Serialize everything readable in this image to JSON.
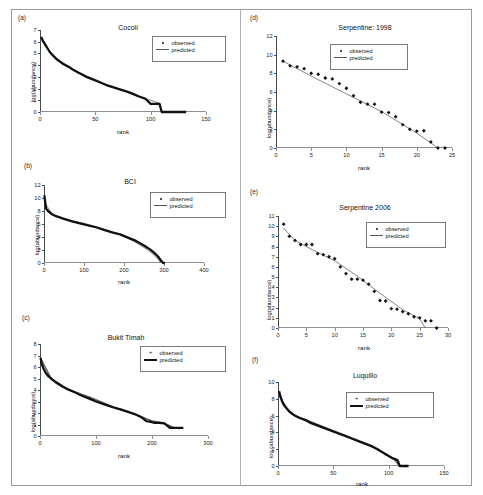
{
  "figure": {
    "background": "#ffffff",
    "frame_color": "#9a9a9a",
    "observed_color": "#111111",
    "predicted_color": "#666666"
  },
  "legend_labels": {
    "observed": "observed",
    "predicted": "predicted"
  },
  "chart_data": [
    {
      "panel": "(a)",
      "type": "line",
      "title": "Cocoli",
      "xlabel": "rank",
      "ylabel": "log(abundance)",
      "xlim": [
        0,
        150
      ],
      "ylim": [
        0,
        7
      ],
      "xticks": [
        0,
        50,
        100,
        150
      ],
      "yticks": [
        0,
        1,
        2,
        3,
        4,
        5,
        6,
        7
      ],
      "grid": false,
      "legend": [
        "observed",
        "predicted"
      ],
      "legend_position": "upper-right",
      "series": [
        {
          "name": "observed",
          "marker": "filled-square",
          "x": [
            1,
            3,
            5,
            7,
            9,
            11,
            13,
            15,
            18,
            21,
            24,
            27,
            30,
            34,
            38,
            42,
            46,
            50,
            55,
            60,
            65,
            70,
            75,
            80,
            85,
            90,
            95,
            100,
            104,
            108,
            110,
            112,
            116,
            120,
            124,
            128,
            132
          ],
          "y": [
            6.4,
            6.0,
            5.7,
            5.4,
            5.1,
            4.9,
            4.7,
            4.5,
            4.3,
            4.1,
            3.95,
            3.8,
            3.6,
            3.4,
            3.2,
            3.0,
            2.85,
            2.7,
            2.5,
            2.3,
            2.15,
            2.0,
            1.85,
            1.7,
            1.5,
            1.3,
            1.15,
            0.7,
            0.7,
            0.7,
            0.0,
            0.0,
            0.0,
            0.0,
            0.0,
            0.0,
            0.0
          ]
        },
        {
          "name": "predicted",
          "x": [
            1,
            10,
            20,
            30,
            40,
            50,
            60,
            70,
            80,
            90,
            100,
            108,
            110
          ],
          "y": [
            6.45,
            5.0,
            4.25,
            3.65,
            3.15,
            2.75,
            2.35,
            2.0,
            1.65,
            1.3,
            1.0,
            0.75,
            0.0
          ]
        }
      ]
    },
    {
      "panel": "(b)",
      "type": "line",
      "title": "BCI",
      "xlabel": "rank",
      "ylabel": "log(abundance)",
      "xlim": [
        0,
        400
      ],
      "ylim": [
        0,
        12
      ],
      "xticks": [
        0,
        100,
        200,
        300,
        400
      ],
      "yticks": [
        0,
        2,
        4,
        6,
        8,
        10,
        12
      ],
      "grid": false,
      "legend": [
        "observed",
        "predicted"
      ],
      "legend_position": "upper-right",
      "series": [
        {
          "name": "observed",
          "marker": "filled-square",
          "x": [
            1,
            5,
            10,
            20,
            30,
            50,
            70,
            90,
            110,
            130,
            150,
            170,
            190,
            210,
            230,
            250,
            265,
            275,
            285,
            292,
            298,
            302
          ],
          "y": [
            10.4,
            8.4,
            8.0,
            7.5,
            7.2,
            6.8,
            6.4,
            6.1,
            5.8,
            5.5,
            5.1,
            4.7,
            4.4,
            3.9,
            3.4,
            2.7,
            2.1,
            1.6,
            1.0,
            0.4,
            0.0,
            0.0
          ]
        },
        {
          "name": "predicted",
          "x": [
            1,
            20,
            50,
            100,
            140,
            180,
            220,
            250,
            270,
            285,
            292
          ],
          "y": [
            9.4,
            7.5,
            6.8,
            6.1,
            5.4,
            4.6,
            3.5,
            2.4,
            1.5,
            0.6,
            0.0
          ]
        }
      ]
    },
    {
      "panel": "(c)",
      "type": "line",
      "title": "Bukit Timah",
      "xlabel": "rank",
      "ylabel": "log(abundance)",
      "xlim": [
        0,
        300
      ],
      "ylim": [
        0,
        8
      ],
      "xticks": [
        0,
        100,
        200,
        300
      ],
      "yticks": [
        0,
        1,
        2,
        3,
        4,
        5,
        6,
        7,
        8
      ],
      "grid": false,
      "legend": [
        "observed",
        "predicted"
      ],
      "legend_position": "upper-right",
      "legend_marker": "plus",
      "series": [
        {
          "name": "observed",
          "marker": "plus",
          "x": [
            1,
            3,
            6,
            10,
            15,
            22,
            30,
            40,
            50,
            62,
            75,
            88,
            100,
            115,
            130,
            145,
            160,
            172,
            182,
            190,
            196,
            205,
            212,
            222,
            232,
            240,
            248,
            256
          ],
          "y": [
            6.8,
            6.3,
            5.9,
            5.5,
            5.2,
            4.9,
            4.6,
            4.3,
            4.05,
            3.8,
            3.5,
            3.25,
            3.0,
            2.75,
            2.5,
            2.3,
            2.05,
            1.85,
            1.6,
            1.3,
            1.25,
            1.15,
            1.15,
            1.1,
            0.7,
            0.7,
            0.7,
            0.7
          ]
        },
        {
          "name": "predicted",
          "x": [
            1,
            20,
            50,
            90,
            130,
            170,
            200,
            220,
            240,
            250
          ],
          "y": [
            6.75,
            5.0,
            4.05,
            3.35,
            2.55,
            1.9,
            1.3,
            1.15,
            0.7,
            0.65
          ]
        }
      ]
    },
    {
      "panel": "(d)",
      "type": "scatter",
      "title": "Serpentine: 1998",
      "xlabel": "rank",
      "ylabel": "log(abundance)",
      "xlim": [
        0,
        25
      ],
      "ylim": [
        0,
        12
      ],
      "xticks": [
        0,
        5,
        10,
        15,
        20,
        25
      ],
      "yticks": [
        0,
        2,
        4,
        6,
        8,
        10,
        12
      ],
      "grid": false,
      "legend": [
        "observed",
        "predicted"
      ],
      "legend_position": "upper-center",
      "series": [
        {
          "name": "observed",
          "marker": "diamond",
          "x": [
            1,
            2,
            3,
            4,
            5,
            6,
            7,
            8,
            9,
            10,
            11,
            12,
            13,
            14,
            15,
            16,
            17,
            18,
            19,
            20,
            21,
            22,
            23,
            24
          ],
          "y": [
            9.3,
            8.8,
            8.7,
            8.5,
            8.0,
            7.9,
            7.5,
            7.4,
            6.9,
            6.4,
            5.6,
            4.9,
            4.7,
            4.7,
            3.85,
            3.8,
            3.35,
            2.5,
            2.0,
            1.8,
            1.85,
            0.65,
            0.0,
            0.0
          ]
        },
        {
          "name": "predicted",
          "x": [
            1,
            5,
            10,
            15,
            20,
            23
          ],
          "y": [
            9.3,
            7.7,
            5.8,
            3.9,
            1.6,
            0.0
          ]
        }
      ]
    },
    {
      "panel": "(e)",
      "type": "scatter",
      "title": "Serpentine 2006",
      "xlabel": "rank",
      "ylabel": "log(abundance)",
      "xlim": [
        0,
        30
      ],
      "ylim": [
        0,
        11
      ],
      "xticks": [
        0,
        5,
        10,
        15,
        20,
        25,
        30
      ],
      "yticks": [
        0,
        1,
        2,
        3,
        4,
        5,
        6,
        7,
        8,
        9,
        10,
        11
      ],
      "grid": false,
      "legend": [
        "observed",
        "predicted"
      ],
      "legend_position": "upper-right",
      "series": [
        {
          "name": "observed",
          "marker": "diamond",
          "x": [
            1,
            2,
            3,
            4,
            5,
            6,
            7,
            8,
            9,
            10,
            11,
            12,
            13,
            14,
            15,
            16,
            17,
            18,
            19,
            20,
            21,
            22,
            23,
            24,
            25,
            26,
            27,
            28
          ],
          "y": [
            10.2,
            9.0,
            8.6,
            8.2,
            8.2,
            8.2,
            7.3,
            7.2,
            7.0,
            6.8,
            6.0,
            5.35,
            4.8,
            4.8,
            4.7,
            4.3,
            3.6,
            2.7,
            2.65,
            1.9,
            1.85,
            1.6,
            1.4,
            1.1,
            1.0,
            0.7,
            0.7,
            0.0
          ]
        },
        {
          "name": "predicted",
          "x": [
            1,
            3,
            6,
            10,
            14,
            18,
            22,
            25,
            26
          ],
          "y": [
            9.8,
            8.6,
            7.7,
            6.6,
            5.1,
            3.4,
            1.8,
            0.9,
            0.0
          ]
        }
      ]
    },
    {
      "panel": "(f)",
      "type": "line",
      "title": "Luquillo",
      "xlabel": "rank",
      "ylabel": "log (abundance)",
      "xlim": [
        0,
        150
      ],
      "ylim": [
        0,
        10
      ],
      "xticks": [
        0,
        50,
        100,
        150
      ],
      "yticks": [
        0,
        2,
        4,
        6,
        8,
        10
      ],
      "grid": false,
      "legend": [
        "observed",
        "predicted"
      ],
      "legend_position": "upper-right",
      "legend_marker": "plus",
      "series": [
        {
          "name": "observed",
          "marker": "plus",
          "x": [
            1,
            2,
            4,
            7,
            10,
            14,
            18,
            22,
            26,
            30,
            36,
            42,
            48,
            54,
            60,
            66,
            72,
            78,
            84,
            90,
            96,
            100,
            104,
            108,
            110,
            114,
            118
          ],
          "y": [
            8.9,
            8.3,
            7.6,
            7.0,
            6.5,
            6.1,
            5.8,
            5.6,
            5.4,
            5.1,
            4.8,
            4.5,
            4.2,
            3.9,
            3.6,
            3.3,
            3.0,
            2.7,
            2.4,
            2.0,
            1.5,
            1.2,
            0.9,
            0.7,
            0.0,
            0.0,
            0.0
          ]
        },
        {
          "name": "predicted",
          "x": [
            1,
            5,
            15,
            25,
            40,
            60,
            80,
            95,
            105,
            110
          ],
          "y": [
            8.9,
            7.2,
            6.0,
            5.5,
            4.7,
            3.7,
            2.6,
            1.6,
            0.8,
            0.0
          ]
        }
      ]
    }
  ]
}
